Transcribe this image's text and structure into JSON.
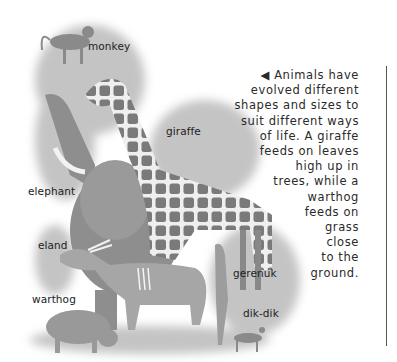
{
  "labels": {
    "monkey": "monkey",
    "giraffe": "giraffe",
    "elephant": "elephant",
    "eland": "eland",
    "warthog": "warthog",
    "gerenuk": "gerenuk",
    "dikdik": "dik-dik"
  },
  "caption": {
    "arrow": "◀",
    "lines": [
      "Animals have",
      "evolved different",
      "shapes and sizes to",
      "suit different ways",
      "of life. A giraffe",
      "feeds on leaves",
      "high up in",
      "trees, while a",
      "warthog",
      "feeds on",
      "grass",
      "close",
      "to the",
      "ground."
    ]
  },
  "colors": {
    "foliage": "#bdbdbd",
    "giraffe_patch": "#7a7a7a",
    "elephant": "#8c8c8c",
    "text": "#222222"
  }
}
